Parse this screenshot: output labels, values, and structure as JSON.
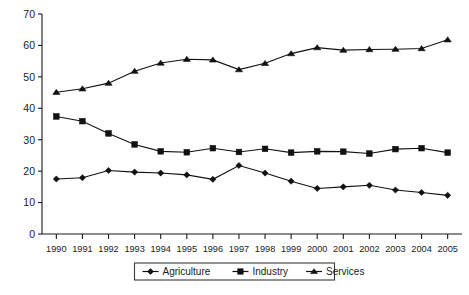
{
  "chart_data": {
    "type": "line",
    "title": "",
    "subtitle": "",
    "xlabel": "",
    "ylabel": "",
    "xlim": [
      1990,
      2005
    ],
    "ylim": [
      0,
      70
    ],
    "ytick_step": 10,
    "yticks": [
      0,
      10,
      20,
      30,
      40,
      50,
      60,
      70
    ],
    "grid": false,
    "legend_position": "bottom-center",
    "categories": [
      "1990",
      "1991",
      "1992",
      "1993",
      "1994",
      "1995",
      "1996",
      "1997",
      "1998",
      "1999",
      "2000",
      "2001",
      "2002",
      "2003",
      "2004",
      "2005"
    ],
    "series": [
      {
        "name": "Agriculture",
        "marker": "diamond",
        "color": "#111111",
        "values": [
          17.5,
          17.9,
          20.2,
          19.7,
          19.4,
          18.8,
          17.4,
          21.8,
          19.4,
          16.8,
          14.5,
          15.0,
          15.5,
          14.0,
          13.2,
          12.3
        ]
      },
      {
        "name": "Industry",
        "marker": "square",
        "color": "#111111",
        "values": [
          37.4,
          35.9,
          32.0,
          28.5,
          26.3,
          26.0,
          27.3,
          26.1,
          27.1,
          25.9,
          26.3,
          26.2,
          25.6,
          27.0,
          27.3,
          25.9
        ]
      },
      {
        "name": "Services",
        "marker": "triangle",
        "color": "#111111",
        "values": [
          45.1,
          46.2,
          48.0,
          51.8,
          54.4,
          55.6,
          55.4,
          52.3,
          54.3,
          57.4,
          59.3,
          58.5,
          58.7,
          58.8,
          59.0,
          61.8
        ]
      }
    ]
  },
  "legend": {
    "items": [
      {
        "label": "Agriculture",
        "marker": "diamond"
      },
      {
        "label": "Industry",
        "marker": "square"
      },
      {
        "label": "Services",
        "marker": "triangle"
      }
    ]
  }
}
